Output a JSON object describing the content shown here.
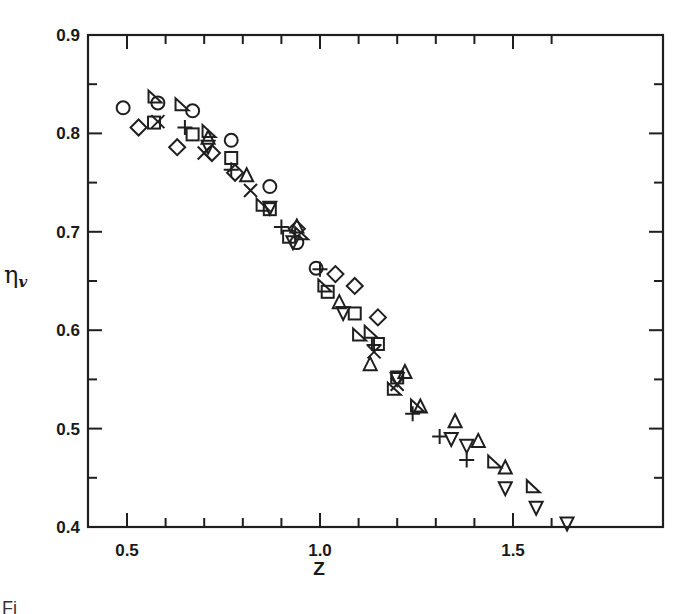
{
  "chart_data": {
    "type": "scatter",
    "title": "",
    "xlabel": "Z",
    "ylabel": "η",
    "ylabel_subscript": "v",
    "xlim": [
      0.4,
      1.7
    ],
    "ylim": [
      0.4,
      0.9
    ],
    "x_ticks": [
      0.5,
      1.0,
      1.5
    ],
    "x_tick_labels": [
      "0.5",
      "1.0",
      "1.5"
    ],
    "x_minor_step": 0.1,
    "y_ticks": [
      0.4,
      0.5,
      0.6,
      0.7,
      0.8,
      0.9
    ],
    "y_tick_labels": [
      "0.4",
      "0.5",
      "0.6",
      "0.7",
      "0.8",
      "0.9"
    ],
    "y_minor_step": 0.05,
    "grid": false,
    "legend": "none",
    "series": [
      {
        "name": "circle",
        "marker": "circle",
        "points": [
          [
            0.49,
            0.826
          ],
          [
            0.58,
            0.831
          ],
          [
            0.67,
            0.823
          ],
          [
            0.77,
            0.793
          ],
          [
            0.87,
            0.746
          ],
          [
            0.94,
            0.689
          ],
          [
            0.99,
            0.663
          ]
        ]
      },
      {
        "name": "triangle-left",
        "marker": "triangle-left",
        "points": [
          [
            0.57,
            0.837
          ],
          [
            0.64,
            0.829
          ],
          [
            0.71,
            0.802
          ],
          [
            0.85,
            0.727
          ],
          [
            0.95,
            0.698
          ],
          [
            1.01,
            0.645
          ],
          [
            1.1,
            0.595
          ],
          [
            1.13,
            0.598
          ],
          [
            1.19,
            0.54
          ],
          [
            1.25,
            0.523
          ],
          [
            1.45,
            0.466
          ],
          [
            1.55,
            0.441
          ]
        ]
      },
      {
        "name": "diamond",
        "marker": "diamond",
        "points": [
          [
            0.53,
            0.806
          ],
          [
            0.63,
            0.786
          ],
          [
            0.72,
            0.78
          ],
          [
            0.78,
            0.76
          ],
          [
            0.94,
            0.703
          ],
          [
            1.04,
            0.657
          ],
          [
            1.09,
            0.645
          ],
          [
            1.15,
            0.613
          ]
        ]
      },
      {
        "name": "square",
        "marker": "square",
        "points": [
          [
            0.57,
            0.811
          ],
          [
            0.67,
            0.799
          ],
          [
            0.77,
            0.775
          ],
          [
            0.87,
            0.723
          ],
          [
            0.92,
            0.695
          ],
          [
            1.02,
            0.639
          ],
          [
            1.09,
            0.617
          ],
          [
            1.15,
            0.586
          ],
          [
            1.2,
            0.552
          ]
        ]
      },
      {
        "name": "cross",
        "marker": "x",
        "points": [
          [
            0.58,
            0.812
          ],
          [
            0.7,
            0.78
          ],
          [
            0.82,
            0.742
          ],
          [
            1.14,
            0.578
          ],
          [
            1.2,
            0.545
          ]
        ]
      },
      {
        "name": "plus",
        "marker": "plus",
        "points": [
          [
            0.65,
            0.806
          ],
          [
            0.77,
            0.763
          ],
          [
            0.9,
            0.705
          ],
          [
            1.0,
            0.662
          ],
          [
            1.14,
            0.585
          ],
          [
            1.24,
            0.515
          ],
          [
            1.31,
            0.492
          ],
          [
            1.38,
            0.468
          ]
        ]
      },
      {
        "name": "triangle-up",
        "marker": "triangle-up",
        "points": [
          [
            0.71,
            0.795
          ],
          [
            0.81,
            0.757
          ],
          [
            0.94,
            0.705
          ],
          [
            1.05,
            0.628
          ],
          [
            1.13,
            0.565
          ],
          [
            1.22,
            0.557
          ],
          [
            1.26,
            0.522
          ],
          [
            1.35,
            0.507
          ],
          [
            1.41,
            0.487
          ],
          [
            1.48,
            0.46
          ]
        ]
      },
      {
        "name": "triangle-down",
        "marker": "triangle-down",
        "points": [
          [
            0.71,
            0.787
          ],
          [
            0.87,
            0.725
          ],
          [
            0.93,
            0.69
          ],
          [
            1.06,
            0.618
          ],
          [
            1.2,
            0.551
          ],
          [
            1.34,
            0.49
          ],
          [
            1.38,
            0.483
          ],
          [
            1.48,
            0.44
          ],
          [
            1.56,
            0.42
          ],
          [
            1.64,
            0.404
          ]
        ]
      }
    ]
  },
  "caption": "Fi"
}
